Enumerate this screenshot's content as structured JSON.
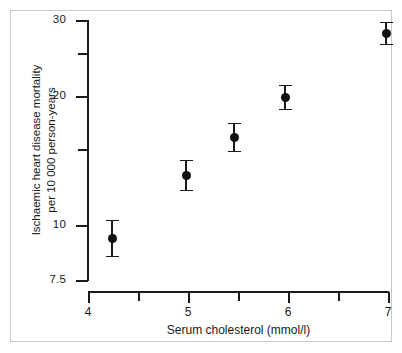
{
  "chart_data": {
    "type": "scatter",
    "title": "",
    "subtitle": "",
    "xlabel": "Serum cholesterol (mmol/l)",
    "ylabel": "Ischaemic heart disease mortality per 10 000 person-years",
    "ylabel_line1": "Ischaemic heart disease mortality",
    "ylabel_line2": "per 10 000 person-years",
    "yscale": "log",
    "xscale": "linear",
    "grid": false,
    "legend": "none",
    "xlim": [
      4,
      7
    ],
    "ylim": [
      7.5,
      30
    ],
    "xticks": [
      4,
      4.5,
      5,
      5.5,
      6,
      6.5,
      7
    ],
    "xtick_labels": [
      "4",
      "",
      "5",
      "",
      "6",
      "",
      "7"
    ],
    "yticks": [
      7.5,
      10,
      15,
      20,
      25,
      30
    ],
    "ytick_labels": [
      "7.5",
      "10",
      "",
      "20",
      "",
      "30"
    ],
    "x": [
      4.24,
      4.98,
      5.46,
      5.97,
      6.98
    ],
    "values": [
      9.3,
      13.8,
      16.9,
      19.9,
      28.5
    ],
    "error_low": [
      8.4,
      12.5,
      15.6,
      18.8,
      27.2
    ],
    "error_high": [
      10.4,
      15.2,
      18.3,
      21.1,
      29.8
    ],
    "series": [
      {
        "name": "Ischaemic heart disease mortality",
        "points": [
          {
            "x": 4.24,
            "y": 9.3,
            "ci_low": 8.4,
            "ci_high": 10.4
          },
          {
            "x": 4.98,
            "y": 13.8,
            "ci_low": 12.5,
            "ci_high": 15.2
          },
          {
            "x": 5.46,
            "y": 16.9,
            "ci_low": 15.6,
            "ci_high": 18.3
          },
          {
            "x": 5.97,
            "y": 19.9,
            "ci_low": 18.8,
            "ci_high": 21.1
          },
          {
            "x": 6.98,
            "y": 28.5,
            "ci_low": 27.2,
            "ci_high": 29.8
          }
        ]
      }
    ],
    "marker": "filled-circle",
    "marker_color": "#111111",
    "axis_color": "#1a1a1a",
    "background_color": "#ffffff",
    "border_color": "#c8c8c8"
  },
  "yticks_px": [
    {
      "label": "30",
      "top": 20,
      "major": true
    },
    {
      "label": "",
      "top": 53,
      "major": false
    },
    {
      "label": "20",
      "top": 96,
      "major": true
    },
    {
      "label": "",
      "top": 149,
      "major": false
    },
    {
      "label": "10",
      "top": 225,
      "major": true
    },
    {
      "label": "7.5",
      "top": 280,
      "major": true
    }
  ],
  "xticks_px": [
    {
      "label": "4",
      "left": 88,
      "major": true
    },
    {
      "label": "",
      "left": 138,
      "major": false
    },
    {
      "label": "5",
      "left": 188,
      "major": true
    },
    {
      "label": "",
      "left": 238,
      "major": false
    },
    {
      "label": "6",
      "left": 288,
      "major": true
    },
    {
      "label": "",
      "left": 338,
      "major": false
    },
    {
      "label": "7",
      "left": 388,
      "major": true
    }
  ],
  "points_px": [
    {
      "cx": 112,
      "cy": 238,
      "top": 220,
      "bottom": 256
    },
    {
      "cx": 186,
      "cy": 175,
      "top": 160,
      "bottom": 190
    },
    {
      "cx": 234,
      "cy": 137,
      "top": 123,
      "bottom": 151
    },
    {
      "cx": 285,
      "cy": 97,
      "top": 85,
      "bottom": 109
    },
    {
      "cx": 386,
      "cy": 33,
      "top": 22,
      "bottom": 44
    }
  ]
}
